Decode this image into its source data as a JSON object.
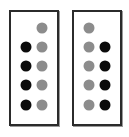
{
  "figure": {
    "background_color": "#ffffff",
    "width": 129,
    "height": 137
  },
  "colors": {
    "dot_black": "#0b0b0b",
    "dot_gray": "#8c8c8c",
    "panel_border": "#2b2b2b",
    "panel_fill": "#ffffff",
    "shadow": "#9a9a9a"
  },
  "chart_data": {
    "type": "table",
    "title": "",
    "xlabel": "",
    "ylabel": "",
    "grid": false,
    "legend": [
      {
        "name": "filled-black-dot",
        "color": "#0b0b0b"
      },
      {
        "name": "filled-gray-dot",
        "color": "#8c8c8c"
      }
    ],
    "rows": 5,
    "columns": 2,
    "panels": [
      {
        "id": "panel-left",
        "label": "",
        "columns": [
          "left",
          "right"
        ],
        "cells": [
          [
            "empty",
            "gray"
          ],
          [
            "black",
            "gray"
          ],
          [
            "black",
            "gray"
          ],
          [
            "black",
            "gray"
          ],
          [
            "black",
            "gray"
          ]
        ],
        "counts": {
          "black": 4,
          "gray": 5,
          "empty": 1
        }
      },
      {
        "id": "panel-right",
        "label": "",
        "columns": [
          "left",
          "right"
        ],
        "cells": [
          [
            "gray",
            "empty"
          ],
          [
            "gray",
            "black"
          ],
          [
            "gray",
            "black"
          ],
          [
            "gray",
            "black"
          ],
          [
            "gray",
            "black"
          ]
        ],
        "counts": {
          "black": 4,
          "gray": 5,
          "empty": 1
        }
      }
    ]
  },
  "layout": {
    "panel_left": {
      "x": 9,
      "y": 10,
      "w": 50,
      "h": 116
    },
    "panel_right": {
      "x": 72,
      "y": 10,
      "w": 50,
      "h": 116
    },
    "dot_diameter": 11,
    "column_centers_pct": [
      32,
      68
    ],
    "row_centers_pct": [
      14,
      31,
      48,
      65,
      83
    ]
  }
}
